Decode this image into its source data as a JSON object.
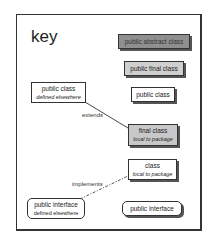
{
  "diagram": {
    "title": "key",
    "boxes": {
      "public_abstract_class": {
        "label": "public abstract class"
      },
      "public_final_class": {
        "label": "public final class"
      },
      "public_class": {
        "label": "public class"
      },
      "public_class_defined_elsewhere": {
        "label": "public class",
        "sublabel": "defined elsewhere"
      },
      "final_class_local": {
        "label": "final class",
        "sublabel": "local to package"
      },
      "class_local": {
        "label": "class",
        "sublabel": "local to package"
      },
      "public_interface_defined_elsewhere": {
        "label": "public interface",
        "sublabel": "defined elsewhere"
      },
      "public_interface": {
        "label": "public interface"
      }
    },
    "relations": {
      "extends": {
        "label": "extends",
        "style": "solid"
      },
      "implements": {
        "label": "implements",
        "style": "dash-dot"
      }
    },
    "colors": {
      "abstract_fill": "#8f8f8f",
      "final_fill": "#cfcfcf",
      "plain_fill": "#ffffff",
      "border": "#333333"
    }
  }
}
